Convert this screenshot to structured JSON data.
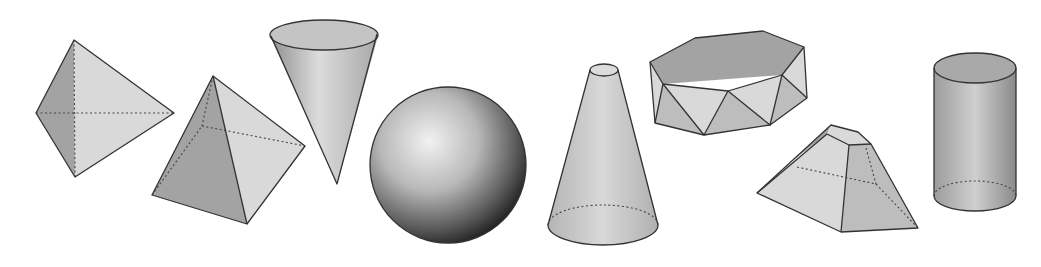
{
  "figure": {
    "solids": [
      {
        "id": "tetrahedron",
        "label": "Tetrahedron (triangular bipyramid view)"
      },
      {
        "id": "square-pyramid",
        "label": "Square pyramid"
      },
      {
        "id": "inverted-cone",
        "label": "Inverted cone"
      },
      {
        "id": "sphere",
        "label": "Sphere"
      },
      {
        "id": "frustum-cone",
        "label": "Truncated cone (frustum)"
      },
      {
        "id": "hexagonal-antiprism",
        "label": "Hexagonal antiprism"
      },
      {
        "id": "truncated-pyramid",
        "label": "Truncated pyramid"
      },
      {
        "id": "cylinder",
        "label": "Cylinder"
      }
    ],
    "colors": {
      "edge": "#333333",
      "face_light": "#d9d9d9",
      "face_mid": "#bdbdbd",
      "face_dark": "#a3a3a3",
      "background": "#ffffff"
    }
  }
}
